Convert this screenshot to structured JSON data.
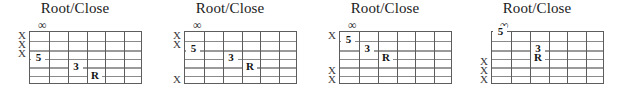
{
  "page": {
    "kind": "guitar-chord-diagram-row",
    "background_color": "#ffffff",
    "grid_line_color": "#5d5d5d",
    "string_line_color": "#8a8a8a",
    "text_color": "#1b1b1b"
  },
  "diagrams": [
    {
      "title": "Root/Close",
      "nut_symbol": "∞",
      "strings": 6,
      "frets": 6,
      "mutes": [
        {
          "string": 1,
          "label": "X"
        },
        {
          "string": 2,
          "label": "X"
        },
        {
          "string": 3,
          "label": "X"
        }
      ],
      "notes": [
        {
          "label": "5",
          "string": 4,
          "fret": 1
        },
        {
          "label": "3",
          "string": 5,
          "fret": 3
        },
        {
          "label": "R",
          "string": 6,
          "fret": 4
        }
      ]
    },
    {
      "title": "Root/Close",
      "nut_symbol": "∞",
      "strings": 6,
      "frets": 6,
      "mutes": [
        {
          "string": 1,
          "label": "X"
        },
        {
          "string": 2,
          "label": "X"
        },
        {
          "string": 6,
          "label": "X"
        }
      ],
      "notes": [
        {
          "label": "5",
          "string": 3,
          "fret": 1
        },
        {
          "label": "3",
          "string": 4,
          "fret": 3
        },
        {
          "label": "R",
          "string": 5,
          "fret": 4
        }
      ]
    },
    {
      "title": "Root/Close",
      "nut_symbol": "∞",
      "strings": 6,
      "frets": 6,
      "mutes": [
        {
          "string": 1,
          "label": "X"
        },
        {
          "string": 5,
          "label": "X"
        },
        {
          "string": 6,
          "label": "X"
        }
      ],
      "notes": [
        {
          "label": "5",
          "string": 2,
          "fret": 1
        },
        {
          "label": "3",
          "string": 3,
          "fret": 2
        },
        {
          "label": "R",
          "string": 4,
          "fret": 3
        }
      ]
    },
    {
      "title": "Root/Close",
      "nut_symbol": "∞",
      "strings": 6,
      "frets": 6,
      "mutes": [
        {
          "string": 4,
          "label": "X"
        },
        {
          "string": 5,
          "label": "X"
        },
        {
          "string": 6,
          "label": "X"
        }
      ],
      "notes": [
        {
          "label": "5",
          "string": 1,
          "fret": 1
        },
        {
          "label": "3",
          "string": 3,
          "fret": 3
        },
        {
          "label": "R",
          "string": 4,
          "fret": 3
        }
      ]
    }
  ],
  "layout": {
    "diagram_origins_x": [
      0,
      155,
      310,
      462
    ],
    "diagram_width": 150,
    "board_left": 29,
    "board_top": 31,
    "board_width": 113,
    "board_height": 53
  }
}
